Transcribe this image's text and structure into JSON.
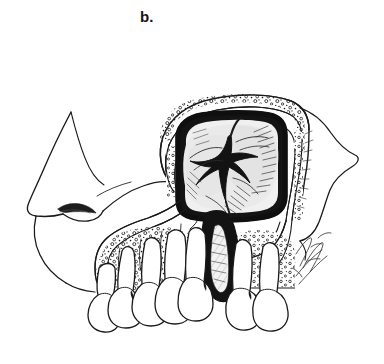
{
  "figure": {
    "panel_label": "b.",
    "background_color": "#ffffff",
    "ink_color": "#1a1a1a",
    "membrane_fill": "#efefef",
    "bone_fill": "#fbfbfb",
    "tooth_fill": "#ffffff",
    "cavity_outline_color": "#111111",
    "style": "black-and-white pen-and-ink medical line illustration",
    "parts": {
      "nose_profile": "nose-profile",
      "upper_lip": "upper-lip",
      "nostril": "nostril",
      "cheek_bone": "zygomatic-bone-contour",
      "sinus_window": "maxillary-sinus-opening",
      "sinus_membrane": "sinus-membrane",
      "sinus_wall": "sinus-bony-wall",
      "cancellous_bone": "cancellous-bone-stipple",
      "nasal_septum": "midline-septum",
      "teeth": "upper-teeth-row",
      "signature": "artist-signature"
    },
    "teeth_count_left": 5,
    "teeth_count_right": 2,
    "artist_signature": ""
  }
}
